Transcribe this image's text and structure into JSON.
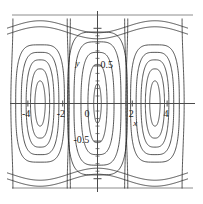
{
  "figure": {
    "kind": "phase-portrait",
    "background_color": "#ffffff",
    "curve_color": "#2b2b2b",
    "axis_color": "#4a4a4a",
    "frame_color": "#8c8c8c"
  },
  "axes": {
    "x_label": "x",
    "y_label": "y",
    "x_ticks": [
      {
        "value": -4,
        "label": "-4"
      },
      {
        "value": -2,
        "label": "-2"
      },
      {
        "value": 2,
        "label": "2"
      },
      {
        "value": 4,
        "label": "4"
      }
    ],
    "y_ticks": [
      {
        "value": 0.5,
        "label": "0.5"
      },
      {
        "value": 0,
        "label": "0"
      },
      {
        "value": -0.5,
        "label": "-0.5"
      }
    ],
    "x_range": [
      -5.2,
      5.2
    ],
    "y_range": [
      -1.15,
      1.15
    ],
    "grid": false
  },
  "chart_data": {
    "type": "line",
    "title": "",
    "xlabel": "x",
    "ylabel": "y",
    "xlim": [
      -5.2,
      5.2
    ],
    "ylim": [
      -1.15,
      1.15
    ],
    "grid": false,
    "legend": null,
    "centers": [
      {
        "x": -3.3,
        "y": 0.0
      },
      {
        "x": 0.0,
        "y": 0.0
      },
      {
        "x": 3.3,
        "y": 0.0
      }
    ],
    "series": [
      {
        "name": "left-loop-1",
        "center_x": -3.3,
        "half_width": 0.3,
        "half_height": 0.3
      },
      {
        "name": "left-loop-2",
        "center_x": -3.3,
        "half_width": 0.55,
        "half_height": 0.46
      },
      {
        "name": "left-loop-3",
        "center_x": -3.3,
        "half_width": 0.8,
        "half_height": 0.58
      },
      {
        "name": "left-loop-4",
        "center_x": -3.3,
        "half_width": 1.08,
        "half_height": 0.68
      },
      {
        "name": "left-loop-5",
        "center_x": -3.3,
        "half_width": 1.4,
        "half_height": 0.78
      },
      {
        "name": "center-loop-1",
        "center_x": 0.0,
        "half_width": 0.22,
        "half_height": 0.26
      },
      {
        "name": "center-loop-2",
        "center_x": 0.0,
        "half_width": 0.55,
        "half_height": 0.52
      },
      {
        "name": "center-loop-3",
        "center_x": 0.0,
        "half_width": 0.95,
        "half_height": 0.68
      },
      {
        "name": "center-loop-4",
        "center_x": 0.0,
        "half_width": 1.35,
        "half_height": 0.82
      },
      {
        "name": "center-loop-5",
        "center_x": 0.0,
        "half_width": 1.72,
        "half_height": 0.95
      },
      {
        "name": "right-loop-1",
        "center_x": 3.3,
        "half_width": 0.3,
        "half_height": 0.3
      },
      {
        "name": "right-loop-2",
        "center_x": 3.3,
        "half_width": 0.55,
        "half_height": 0.46
      },
      {
        "name": "right-loop-3",
        "center_x": 3.3,
        "half_width": 0.8,
        "half_height": 0.58
      },
      {
        "name": "right-loop-4",
        "center_x": 3.3,
        "half_width": 1.08,
        "half_height": 0.68
      },
      {
        "name": "right-loop-5",
        "center_x": 3.3,
        "half_width": 1.4,
        "half_height": 0.78
      },
      {
        "name": "open-upper-1",
        "y_offset": 1.02
      },
      {
        "name": "open-upper-2",
        "y_offset": 1.1
      },
      {
        "name": "open-lower-1",
        "y_offset": -1.02
      },
      {
        "name": "open-lower-2",
        "y_offset": -1.1
      }
    ]
  }
}
